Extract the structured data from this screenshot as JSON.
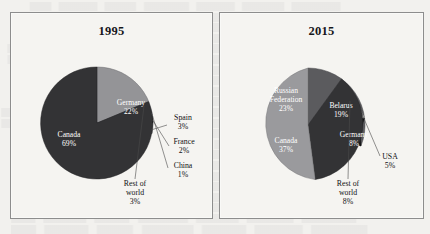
{
  "figure": {
    "panels": [
      {
        "id": "1995",
        "title": "1995"
      },
      {
        "id": "2015",
        "title": "2015"
      }
    ]
  },
  "chart_data": [
    {
      "type": "pie",
      "title": "1995",
      "categories": [
        "Canada",
        "Germany",
        "Spain",
        "France",
        "China",
        "Rest of world"
      ],
      "values": [
        69,
        22,
        3,
        2,
        1,
        3
      ],
      "unit": "%",
      "labels": [
        {
          "name": "Canada",
          "value": "69%",
          "placement": "inside"
        },
        {
          "name": "Germany",
          "value": "22%",
          "placement": "inside"
        },
        {
          "name": "Spain",
          "value": "3%",
          "placement": "outside"
        },
        {
          "name": "France",
          "value": "2%",
          "placement": "outside"
        },
        {
          "name": "China",
          "value": "1%",
          "placement": "outside"
        },
        {
          "name": "Rest of world",
          "value": "3%",
          "placement": "outside"
        }
      ],
      "colors": [
        "#333335",
        "#949497",
        "#6e6e71",
        "#111113",
        "#9d9da0",
        "#5d5d60"
      ],
      "legend": "none",
      "grid": false
    },
    {
      "type": "pie",
      "title": "2015",
      "categories": [
        "Canada",
        "Russian Federation",
        "Belarus",
        "Germany",
        "Rest of world",
        "USA"
      ],
      "values": [
        37,
        23,
        19,
        8,
        8,
        5
      ],
      "unit": "%",
      "labels": [
        {
          "name": "Canada",
          "value": "37%",
          "placement": "inside"
        },
        {
          "name": "Russian Federation",
          "value": "23%",
          "placement": "inside"
        },
        {
          "name": "Belarus",
          "value": "19%",
          "placement": "inside"
        },
        {
          "name": "Germany",
          "value": "8%",
          "placement": "inside"
        },
        {
          "name": "Rest of world",
          "value": "8%",
          "placement": "outside"
        },
        {
          "name": "USA",
          "value": "5%",
          "placement": "outside"
        }
      ],
      "colors": [
        "#333335",
        "#9a9a9d",
        "#5b5b5e",
        "#0d0d0f",
        "#8f8f92",
        "#d9d9d6"
      ],
      "legend": "none",
      "grid": false
    }
  ],
  "panel_1995": {
    "title": "1995",
    "canada_name": "Canada",
    "canada_value": "69%",
    "germany_name": "Germany",
    "germany_value": "22%",
    "spain_name": "Spain",
    "spain_value": "3%",
    "france_name": "France",
    "france_value": "2%",
    "china_name": "China",
    "china_value": "1%",
    "rest_line1": "Rest of",
    "rest_line2": "world",
    "rest_value": "3%"
  },
  "panel_2015": {
    "title": "2015",
    "canada_name": "Canada",
    "canada_value": "37%",
    "russia_line1": "Russian",
    "russia_line2": "Federation",
    "russia_value": "23%",
    "belarus_name": "Belarus",
    "belarus_value": "19%",
    "germany_name": "Germany",
    "germany_value": "8%",
    "usa_name": "USA",
    "usa_value": "5%",
    "rest_line1": "Rest of",
    "rest_line2": "world",
    "rest_value": "8%"
  }
}
